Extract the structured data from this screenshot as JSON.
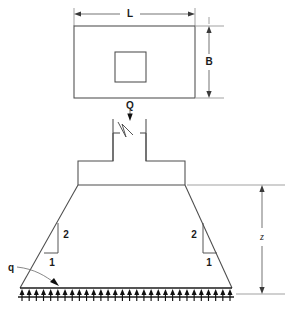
{
  "figure": {
    "background_color": "#ffffff",
    "line_color": "#4c4c4c",
    "accent_color": "#101010"
  },
  "plan_view": {
    "name": "plan-view",
    "outer_rect": {
      "x": 74,
      "y": 26,
      "width": 121,
      "height": 72
    },
    "inner_square": {
      "x": 115,
      "y": 52,
      "width": 31,
      "height": 30
    },
    "dimensions": [
      {
        "key": "length",
        "label": "L",
        "orientation": "horizontal",
        "x1": 74,
        "x2": 195,
        "y": 14
      },
      {
        "key": "width",
        "label": "B",
        "orientation": "vertical",
        "x": 208,
        "y1": 26,
        "y2": 98
      }
    ]
  },
  "elevation_view": {
    "name": "elevation-view",
    "load_label": "Q",
    "pressure_label": "q",
    "depth_label": "z",
    "slope_rise_label": "2",
    "slope_run_label": "1",
    "column": {
      "left_x": 113,
      "right_x": 146,
      "top_y": 119,
      "bottom_y": 161
    },
    "footing_block": {
      "left_x": 78,
      "right_x": 185,
      "top_y": 161,
      "bottom_y": 185
    },
    "spread_base": {
      "left_x": 20,
      "right_x": 232,
      "y": 288
    },
    "depth_dimension": {
      "x": 262,
      "y1": 185,
      "y2": 288
    },
    "pressure_arrow_count": 30
  },
  "labels": {
    "L": "L",
    "B": "B",
    "Q": "Q",
    "q": "q",
    "z": "z",
    "rise": "2",
    "run": "1",
    "rise_right": "2",
    "run_right": "1"
  }
}
